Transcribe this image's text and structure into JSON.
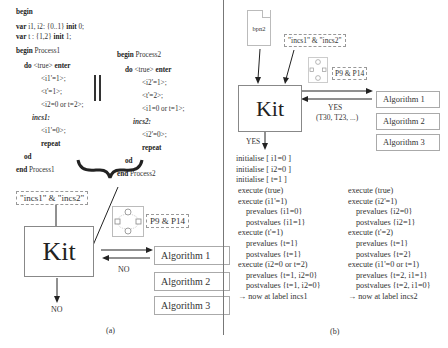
{
  "panel_a": {
    "caption": "(a)",
    "header": {
      "begin": "begin",
      "var1_kw": "var",
      "var1_text": " i1, i2: {0..1} ",
      "var1_init_kw": "init",
      "var1_init_val": " 0;",
      "var2_kw": "var",
      "var2_text": " t : {1,2} ",
      "var2_init_kw": "init",
      "var2_init_val": " 1;"
    },
    "process1": {
      "begin_kw": "begin",
      "name": " Process1",
      "do_kw": "do",
      "guard": " <true> ",
      "enter_kw": "enter",
      "stmts": [
        "<i1'=1>;",
        "<t'=1>;",
        "<i2=0  or  t=2>;"
      ],
      "label": "incs1:",
      "after_label": "<i1'=0>;",
      "repeat": "repeat",
      "od": "od",
      "end_kw": "end",
      "end_name": " Process1"
    },
    "process2": {
      "begin_kw": "begin",
      "name": " Process2",
      "do_kw": "do",
      "guard": " <true> ",
      "enter_kw": "enter",
      "stmts": [
        "<i2'=1>;",
        "<t'=2>;",
        "<i1=0  or  t=1>;"
      ],
      "label": "incs2:",
      "after_label": "<i2'=0>;",
      "repeat": "repeat",
      "od": "od",
      "end_kw": "end",
      "end_name": " Process2"
    },
    "parallel_symbol": "||",
    "labels_box": "\"incs1\" & \"incs2\"",
    "properties_box": "P9 & P14",
    "kit_label": "Kit",
    "reply_label": "NO",
    "output_label": "NO",
    "algorithms": [
      "Algorithm 1",
      "Algorithm 2",
      "Algorithm 3"
    ]
  },
  "panel_b": {
    "caption": "(b)",
    "file_label": "bpn2",
    "labels_box": "\"incs1\" & \"incs2\"",
    "properties_box": "P9 & P14",
    "kit_label": "Kit",
    "reply_label": "YES",
    "reply_detail": "(T30, T23, ...)",
    "output_label": "YES",
    "algorithms": [
      "Algorithm 1",
      "Algorithm 2",
      "Algorithm 3"
    ],
    "init_lines": [
      "initialise [ i1=0 ]",
      "initialise [ i2=0 ]",
      "initialise [ t=1 ]"
    ],
    "trace1": [
      "execute (true)",
      "execute (i1'=1)",
      "prevalues {i1=0}",
      "postvalues {i1=1}",
      "execute (t'=1)",
      "prevalues {t=1}",
      "postvalues {t=1}",
      "execute (i2=0 or t=2)",
      "prevalues {t=1, i2=0}",
      "postvalues {t=1, i2=0}",
      "→ now at label incs1"
    ],
    "trace2": [
      "execute (true)",
      "execute (i2'=1)",
      "prevalues {i2=0}",
      "postvalues {i2=1}",
      "execute (t'=2)",
      "prevalues {t=1}",
      "postvalues {t=2}",
      "execute (i1'=0 or t=1)",
      "prevalues {t=2, i1=1}",
      "postvalues {t=2, i1=0}",
      "→ now at label incs2"
    ]
  }
}
